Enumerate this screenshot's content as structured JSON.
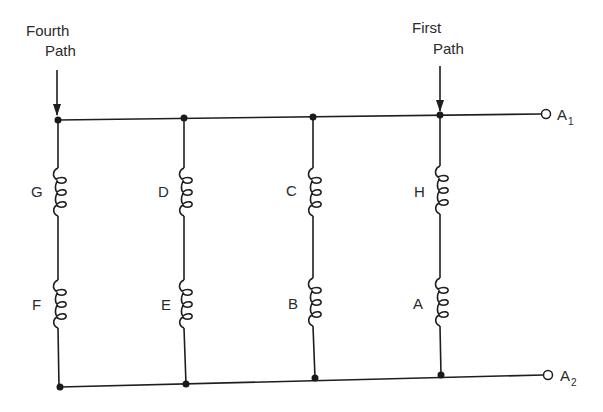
{
  "diagram": {
    "type": "parallel-winding-circuit",
    "annotations": [
      {
        "id": "fourth-path",
        "line1": "Fourth",
        "line2": "Path"
      },
      {
        "id": "first-path",
        "line1": "First",
        "line2": "Path"
      }
    ],
    "terminals": [
      {
        "id": "A1",
        "letter": "A",
        "sub": "1"
      },
      {
        "id": "A2",
        "letter": "A",
        "sub": "2"
      }
    ],
    "branches": [
      {
        "name": "fourth-path",
        "upper_coil": "G",
        "lower_coil": "F"
      },
      {
        "name": "third-path",
        "upper_coil": "D",
        "lower_coil": "E"
      },
      {
        "name": "second-path",
        "upper_coil": "C",
        "lower_coil": "B"
      },
      {
        "name": "first-path",
        "upper_coil": "H",
        "lower_coil": "A"
      }
    ],
    "colors": {
      "line": "#1e1e1e",
      "background": "#ffffff"
    }
  }
}
